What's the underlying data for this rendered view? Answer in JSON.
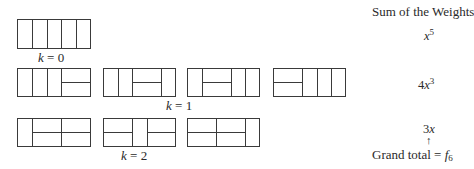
{
  "title": "Sum of the Weights",
  "rows": [
    {
      "k_label": "k",
      "k_value": "0",
      "weight_coef": "",
      "weight_var": "x",
      "weight_exp": "5",
      "tilings": [
        {
          "desc": "5 vertical cells",
          "cells": [
            "v",
            "v",
            "v",
            "v",
            "v"
          ]
        }
      ]
    },
    {
      "k_label": "k",
      "k_value": "1",
      "weight_coef": "4",
      "weight_var": "x",
      "weight_exp": "3",
      "tilings": [
        {
          "desc": "v v v H",
          "cells": [
            "v",
            "v",
            "v",
            "H"
          ]
        },
        {
          "desc": "v v H v",
          "cells": [
            "v",
            "v",
            "H",
            "v"
          ]
        },
        {
          "desc": "v H v v",
          "cells": [
            "v",
            "H",
            "v",
            "v"
          ]
        },
        {
          "desc": "H v v v",
          "cells": [
            "H",
            "v",
            "v",
            "v"
          ]
        }
      ]
    },
    {
      "k_label": "k",
      "k_value": "2",
      "weight_coef": "3",
      "weight_var": "x",
      "weight_exp": "",
      "tilings": [
        {
          "desc": "v H H",
          "cells": [
            "v",
            "H",
            "H"
          ]
        },
        {
          "desc": "H v H",
          "cells": [
            "H",
            "v",
            "H"
          ]
        },
        {
          "desc": "H H v",
          "cells": [
            "H",
            "H",
            "v"
          ]
        }
      ]
    }
  ],
  "grand_total": {
    "label": "Grand total",
    "equals": "=",
    "arrow": "↑",
    "f": "f",
    "f_sub": "6"
  }
}
